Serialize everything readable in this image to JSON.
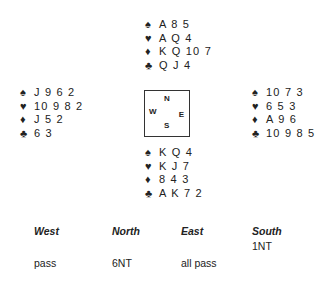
{
  "hands": {
    "north": {
      "spades": "A 8 5",
      "hearts": "A Q 4",
      "diamonds": "K Q 10 7",
      "clubs": "Q J 4"
    },
    "west": {
      "spades": "J 9 6 2",
      "hearts": "10 9 8 2",
      "diamonds": "J 5 2",
      "clubs": "6 3"
    },
    "east": {
      "spades": "10 7 3",
      "hearts": "6 5 3",
      "diamonds": "A 9 6",
      "clubs": "10 9 8 5"
    },
    "south": {
      "spades": "K Q 4",
      "hearts": "K J 7",
      "diamonds": "8 4 3",
      "clubs": "A K 7 2"
    }
  },
  "suit_symbols": {
    "spades": "♠",
    "hearts": "♥",
    "diamonds": "♦",
    "clubs": "♣"
  },
  "compass": {
    "n": "N",
    "s": "S",
    "e": "E",
    "w": "W"
  },
  "bidding": {
    "headers": [
      "West",
      "North",
      "East",
      "South"
    ],
    "rows": [
      [
        "",
        "",
        "",
        "1NT"
      ],
      [
        "pass",
        "6NT",
        "all pass",
        ""
      ]
    ]
  }
}
